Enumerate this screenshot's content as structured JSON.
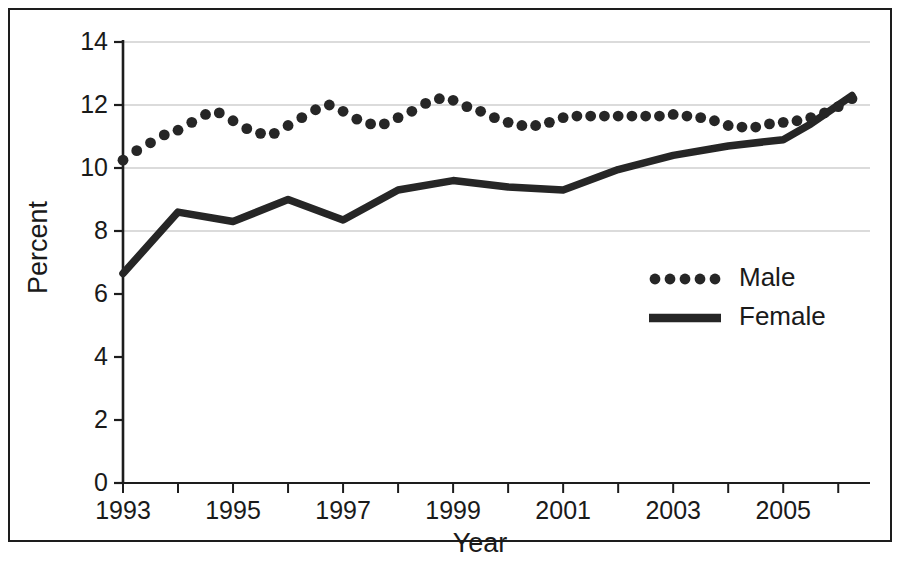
{
  "chart_data": {
    "type": "line",
    "title": "",
    "xlabel": "Year",
    "ylabel": "Percent",
    "ylim": [
      0,
      14
    ],
    "ytick_labels": [
      "0",
      "2",
      "4",
      "6",
      "8",
      "10",
      "12",
      "14"
    ],
    "ytick_values": [
      0,
      2,
      4,
      6,
      8,
      10,
      12,
      14
    ],
    "gridlines_at": [
      8,
      10,
      12,
      14
    ],
    "grid": true,
    "xlim": [
      1993.0,
      2006.25
    ],
    "xtick_labels": [
      "1993",
      "1995",
      "1997",
      "1999",
      "2001",
      "2003",
      "2005"
    ],
    "xtick_values": [
      1993,
      1995,
      1997,
      1999,
      2001,
      2003,
      2005
    ],
    "xtick_minor_values": [
      1994,
      1996,
      1998,
      2000,
      2002,
      2004,
      2006
    ],
    "legend_position": "center-right",
    "series": [
      {
        "name": "Male",
        "style": "dotted",
        "color": "#262626",
        "x": [
          1993.0,
          1993.25,
          1993.5,
          1993.75,
          1994.0,
          1994.25,
          1994.5,
          1994.75,
          1995.0,
          1995.25,
          1995.5,
          1995.75,
          1996.0,
          1996.25,
          1996.5,
          1996.75,
          1997.0,
          1997.25,
          1997.5,
          1997.75,
          1998.0,
          1998.25,
          1998.5,
          1998.75,
          1999.0,
          1999.25,
          1999.5,
          1999.75,
          2000.0,
          2000.25,
          2000.5,
          2000.75,
          2001.0,
          2001.25,
          2001.5,
          2001.75,
          2002.0,
          2002.25,
          2002.5,
          2002.75,
          2003.0,
          2003.25,
          2003.5,
          2003.75,
          2004.0,
          2004.25,
          2004.5,
          2004.75,
          2005.0,
          2005.25,
          2005.5,
          2005.75,
          2006.0,
          2006.25
        ],
        "values": [
          10.25,
          10.55,
          10.8,
          11.05,
          11.2,
          11.45,
          11.7,
          11.75,
          11.5,
          11.25,
          11.1,
          11.1,
          11.35,
          11.6,
          11.85,
          12.0,
          11.8,
          11.55,
          11.4,
          11.4,
          11.6,
          11.8,
          12.05,
          12.2,
          12.15,
          11.95,
          11.8,
          11.6,
          11.45,
          11.35,
          11.35,
          11.45,
          11.6,
          11.65,
          11.65,
          11.65,
          11.65,
          11.65,
          11.65,
          11.65,
          11.7,
          11.65,
          11.6,
          11.5,
          11.35,
          11.3,
          11.3,
          11.4,
          11.45,
          11.5,
          11.6,
          11.75,
          11.95,
          12.2
        ]
      },
      {
        "name": "Female",
        "style": "solid",
        "color": "#262626",
        "x": [
          1993.0,
          1994.0,
          1995.0,
          1996.0,
          1997.0,
          1998.0,
          1999.0,
          2000.0,
          2001.0,
          2002.0,
          2003.0,
          2004.0,
          2005.0,
          2005.5,
          2006.25
        ],
        "values": [
          6.65,
          8.6,
          8.3,
          9.0,
          8.35,
          9.3,
          9.6,
          9.4,
          9.3,
          9.95,
          10.4,
          10.7,
          10.9,
          11.4,
          12.3
        ]
      }
    ]
  },
  "legend": {
    "entries": [
      {
        "label": "Male",
        "marker": "dotted"
      },
      {
        "label": "Female",
        "marker": "solid"
      }
    ]
  },
  "axes": {
    "x_title": "Year",
    "y_title": "Percent"
  }
}
